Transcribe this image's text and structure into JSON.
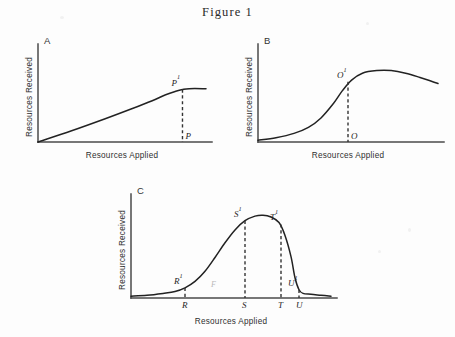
{
  "figure": {
    "title": "Figure 1",
    "background_color": "#fdfdfd",
    "ink_color": "#222222"
  },
  "axis_titles": {
    "x": "Resources Applied",
    "y": "Resources Received"
  },
  "panels": [
    {
      "letter": "A",
      "curve_shape": "saturating",
      "description": "Curve rises steadily from the origin then flattens into a horizontal plateau.",
      "x_axis_label": "Resources Applied",
      "y_axis_label": "Resources Received",
      "curve_points": [
        {
          "x": 0,
          "y": 0
        },
        {
          "x": 20,
          "y": 13
        },
        {
          "x": 40,
          "y": 27
        },
        {
          "x": 55,
          "y": 38
        },
        {
          "x": 68,
          "y": 48
        },
        {
          "x": 76,
          "y": 55
        },
        {
          "x": 82,
          "y": 59
        },
        {
          "x": 86,
          "y": 61
        },
        {
          "x": 90,
          "y": 62
        },
        {
          "x": 100,
          "y": 62
        }
      ],
      "markers": [
        {
          "curve_label": "P",
          "curve_superscript": "1",
          "axis_label": "P",
          "axis_superscript": "",
          "x": 86,
          "y": 61,
          "dashed_drop": true
        }
      ]
    },
    {
      "letter": "B",
      "curve_shape": "sigmoid-then-declining",
      "description": "S-shaped rise through an inflection at O-prime, peaking just past it, then declining gradually.",
      "x_axis_label": "Resources Applied",
      "y_axis_label": "Resources Received",
      "curve_points": [
        {
          "x": 0,
          "y": 2
        },
        {
          "x": 10,
          "y": 5
        },
        {
          "x": 20,
          "y": 10
        },
        {
          "x": 28,
          "y": 17
        },
        {
          "x": 35,
          "y": 28
        },
        {
          "x": 42,
          "y": 45
        },
        {
          "x": 47,
          "y": 60
        },
        {
          "x": 52,
          "y": 72
        },
        {
          "x": 58,
          "y": 80
        },
        {
          "x": 66,
          "y": 83
        },
        {
          "x": 74,
          "y": 83
        },
        {
          "x": 82,
          "y": 80
        },
        {
          "x": 90,
          "y": 75
        },
        {
          "x": 100,
          "y": 68
        }
      ],
      "markers": [
        {
          "curve_label": "O",
          "curve_superscript": "1",
          "axis_label": "O",
          "axis_superscript": "",
          "x": 50,
          "y": 70,
          "dashed_drop": true
        }
      ]
    },
    {
      "letter": "C",
      "curve_shape": "bell",
      "description": "Low flat tail, gradual rise to a rounded peak, steep drop back to a long flat tail.",
      "x_axis_label": "Resources Applied",
      "y_axis_label": "Resources Received",
      "curve_points": [
        {
          "x": 0,
          "y": 2
        },
        {
          "x": 8,
          "y": 3
        },
        {
          "x": 16,
          "y": 5
        },
        {
          "x": 22,
          "y": 7
        },
        {
          "x": 27,
          "y": 11
        },
        {
          "x": 32,
          "y": 18
        },
        {
          "x": 37,
          "y": 29
        },
        {
          "x": 42,
          "y": 44
        },
        {
          "x": 47,
          "y": 60
        },
        {
          "x": 52,
          "y": 74
        },
        {
          "x": 57,
          "y": 84
        },
        {
          "x": 62,
          "y": 89
        },
        {
          "x": 66,
          "y": 90
        },
        {
          "x": 70,
          "y": 88
        },
        {
          "x": 74,
          "y": 82
        },
        {
          "x": 77,
          "y": 68
        },
        {
          "x": 80,
          "y": 45
        },
        {
          "x": 82,
          "y": 22
        },
        {
          "x": 84,
          "y": 9
        },
        {
          "x": 86,
          "y": 5
        },
        {
          "x": 90,
          "y": 4
        },
        {
          "x": 95,
          "y": 3
        },
        {
          "x": 100,
          "y": 2
        }
      ],
      "markers": [
        {
          "curve_label": "R",
          "curve_superscript": "1",
          "axis_label": "R",
          "axis_superscript": "",
          "x": 27,
          "y": 11,
          "dashed_drop": true
        },
        {
          "curve_label": "S",
          "curve_superscript": "1",
          "axis_label": "S",
          "axis_superscript": "",
          "x": 57,
          "y": 84,
          "dashed_drop": true
        },
        {
          "curve_label": "T",
          "curve_superscript": "1",
          "axis_label": "T",
          "axis_superscript": "",
          "x": 75,
          "y": 80,
          "dashed_drop": true
        },
        {
          "curve_label": "U",
          "curve_superscript": "1",
          "axis_label": "U",
          "axis_superscript": "",
          "x": 84,
          "y": 9,
          "dashed_drop": true
        }
      ],
      "faint_mark": "F"
    }
  ],
  "chart_data": {
    "type": "line",
    "title": "Figure 1",
    "xlabel": "Resources Applied",
    "ylabel": "Resources Received",
    "grid": false,
    "legend": "none",
    "axes_ticks": "none",
    "xlim": [
      0,
      100
    ],
    "ylim": [
      0,
      100
    ],
    "panels": [
      {
        "name": "A",
        "series": [
          {
            "name": "saturating response",
            "x": [
              0,
              20,
              40,
              55,
              68,
              76,
              82,
              86,
              90,
              100
            ],
            "values": [
              0,
              13,
              27,
              38,
              48,
              55,
              59,
              61,
              62,
              62
            ]
          }
        ],
        "annotations": [
          {
            "text": "P¹",
            "x": 86,
            "y": 61
          },
          {
            "text": "P",
            "x": 86,
            "y": 0
          }
        ]
      },
      {
        "name": "B",
        "series": [
          {
            "name": "sigmoid then declining response",
            "x": [
              0,
              10,
              20,
              28,
              35,
              42,
              47,
              52,
              58,
              66,
              74,
              82,
              90,
              100
            ],
            "values": [
              2,
              5,
              10,
              17,
              28,
              45,
              60,
              72,
              80,
              83,
              83,
              80,
              75,
              68
            ]
          }
        ],
        "annotations": [
          {
            "text": "O¹",
            "x": 50,
            "y": 70
          },
          {
            "text": "O",
            "x": 50,
            "y": 0
          }
        ]
      },
      {
        "name": "C",
        "series": [
          {
            "name": "bell-shaped response",
            "x": [
              0,
              8,
              16,
              22,
              27,
              32,
              37,
              42,
              47,
              52,
              57,
              62,
              66,
              70,
              74,
              77,
              80,
              82,
              84,
              86,
              90,
              95,
              100
            ],
            "values": [
              2,
              3,
              5,
              7,
              11,
              18,
              29,
              44,
              60,
              74,
              84,
              89,
              90,
              88,
              82,
              68,
              45,
              22,
              9,
              5,
              4,
              3,
              2
            ]
          }
        ],
        "annotations": [
          {
            "text": "R¹",
            "x": 27,
            "y": 11
          },
          {
            "text": "R",
            "x": 27,
            "y": 0
          },
          {
            "text": "S¹",
            "x": 57,
            "y": 84
          },
          {
            "text": "S",
            "x": 57,
            "y": 0
          },
          {
            "text": "T¹",
            "x": 75,
            "y": 80
          },
          {
            "text": "T",
            "x": 75,
            "y": 0
          },
          {
            "text": "U¹",
            "x": 84,
            "y": 9
          },
          {
            "text": "U",
            "x": 84,
            "y": 0
          }
        ]
      }
    ]
  }
}
